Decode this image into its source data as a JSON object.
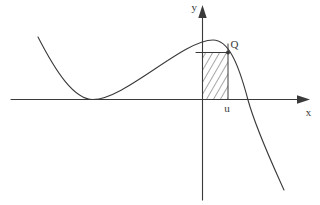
{
  "figure": {
    "type": "function-graph-sketch",
    "background": "#ffffff",
    "colors": {
      "ink": "#3a3a3a"
    },
    "labels": {
      "y_axis": "y",
      "x_axis": "x",
      "point": "Q",
      "abscissa": "u"
    }
  }
}
